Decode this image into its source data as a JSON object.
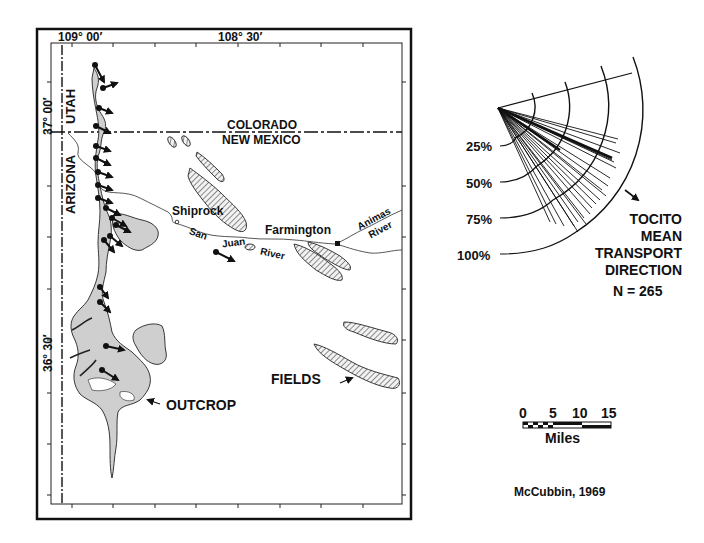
{
  "map": {
    "longitude_labels": [
      "109° 00′",
      "108° 30′"
    ],
    "latitude_labels": [
      "37° 00′",
      "36° 30′"
    ],
    "state_labels": {
      "arizona": "ARIZONA",
      "utah": "UTAH",
      "colorado": "COLORADO",
      "new_mexico": "NEW MEXICO"
    },
    "places": {
      "shiprock": "Shiprock",
      "farmington": "Farmington"
    },
    "rivers": {
      "san": "San",
      "juan": "Juan",
      "river1": "River",
      "animas": "Animas",
      "river2": "River"
    },
    "callouts": {
      "outcrop": "OUTCROP",
      "fields": "FIELDS"
    }
  },
  "rose_diagram": {
    "ring_labels": [
      "25%",
      "50%",
      "75%",
      "100%"
    ],
    "title_lines": [
      "TOCITO",
      "MEAN",
      "TRANSPORT",
      "DIRECTION"
    ],
    "n_label": "N = 265"
  },
  "scale_bar": {
    "ticks": [
      "0",
      "5",
      "10",
      "15"
    ],
    "unit": "Miles"
  },
  "citation": "McCubbin, 1969",
  "colors": {
    "ink": "#111111",
    "outcrop_fill": "#cfcfcf",
    "field_hatch": "#555555"
  }
}
